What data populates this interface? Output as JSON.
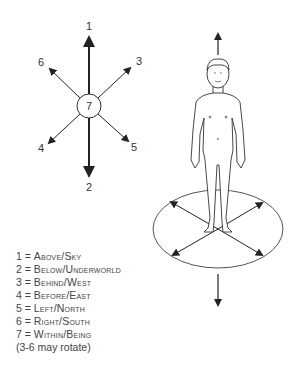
{
  "diagram": {
    "compass": {
      "center_label": "7",
      "labels": {
        "up": "1",
        "down": "2",
        "upper_right": "3",
        "lower_left": "4",
        "lower_right": "5",
        "upper_left": "6"
      }
    },
    "figure": {
      "description": "Standing human figure on an elliptical ground plane with arrows pointing up, down, and four horizontal directions"
    },
    "legend": [
      {
        "num": "1",
        "text": "Above/Sky"
      },
      {
        "num": "2",
        "text": "Below/Underworld"
      },
      {
        "num": "3",
        "text": "Behind/West"
      },
      {
        "num": "4",
        "text": "Before/East"
      },
      {
        "num": "5",
        "text": "Left/North"
      },
      {
        "num": "6",
        "text": "Right/South"
      },
      {
        "num": "7",
        "text": "Within/Being"
      }
    ],
    "note": "(3-6 may rotate)"
  }
}
